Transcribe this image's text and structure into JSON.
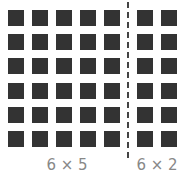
{
  "diagram": {
    "rows": 6,
    "left_group": {
      "cols": 5,
      "label": "6 × 5"
    },
    "right_group": {
      "cols": 2,
      "label": "6 × 2"
    },
    "square_color": "#333333",
    "label_color": "#888888",
    "divider": "dashed-vertical"
  }
}
